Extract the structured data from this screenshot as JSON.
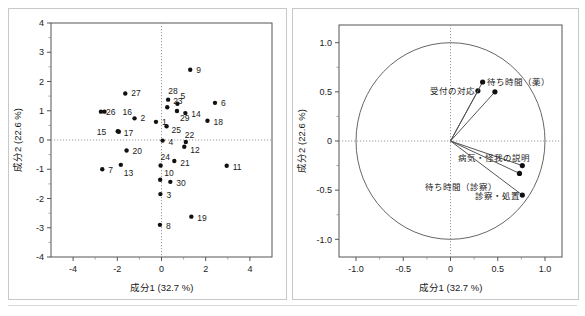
{
  "figure": {
    "name": "pca-biplot-figure",
    "panels": [
      "score-plot",
      "loading-plot"
    ]
  },
  "chart_data": [
    {
      "type": "scatter",
      "name": "score-plot",
      "title": "",
      "xlabel": "成分1  (32.7 %)",
      "ylabel": "成分2  (22.6 %)",
      "xlim": [
        -5,
        5
      ],
      "ylim": [
        -4,
        4
      ],
      "xticks": [
        -4,
        -2,
        0,
        2,
        4
      ],
      "xticklabels": [
        "-4",
        "-2",
        "0",
        "2",
        "4"
      ],
      "yticks": [
        -4,
        -3,
        -2,
        -1,
        0,
        1,
        2,
        3,
        4
      ],
      "yticklabels": [
        "-4",
        "-3",
        "-2",
        "-1",
        "0",
        "1",
        "2",
        "3",
        "4"
      ],
      "grid": false,
      "zero_lines": true,
      "legend": "none",
      "points": [
        {
          "label": "1",
          "x": -0.25,
          "y": 0.62,
          "lx": 6,
          "ly": 3
        },
        {
          "label": "2",
          "x": -1.22,
          "y": 0.74,
          "lx": 6,
          "ly": 3
        },
        {
          "label": "3",
          "x": -0.05,
          "y": -1.85,
          "lx": 6,
          "ly": 4
        },
        {
          "label": "4",
          "x": 0.05,
          "y": -0.02,
          "lx": 6,
          "ly": 4
        },
        {
          "label": "5",
          "x": 0.72,
          "y": 1.24,
          "lx": 3,
          "ly": -5
        },
        {
          "label": "6",
          "x": 2.42,
          "y": 1.27,
          "lx": 6,
          "ly": 3
        },
        {
          "label": "7",
          "x": -2.68,
          "y": -1.0,
          "lx": 6,
          "ly": 4
        },
        {
          "label": "8",
          "x": -0.07,
          "y": -2.9,
          "lx": 6,
          "ly": 4
        },
        {
          "label": "9",
          "x": 1.3,
          "y": 2.4,
          "lx": 6,
          "ly": 3
        },
        {
          "label": "10",
          "x": -0.06,
          "y": -1.36,
          "lx": 4,
          "ly": -4
        },
        {
          "label": "11",
          "x": 2.95,
          "y": -0.88,
          "lx": 6,
          "ly": 4
        },
        {
          "label": "12",
          "x": 1.03,
          "y": -0.23,
          "lx": 6,
          "ly": 6
        },
        {
          "label": "13",
          "x": -1.84,
          "y": -0.85,
          "lx": 3,
          "ly": 11
        },
        {
          "label": "14",
          "x": 1.08,
          "y": 0.92,
          "lx": 6,
          "ly": 4
        },
        {
          "label": "15",
          "x": -1.98,
          "y": 0.3,
          "lx": -21,
          "ly": 4
        },
        {
          "label": "16",
          "x": -2.58,
          "y": 0.97,
          "lx": 18,
          "ly": 3
        },
        {
          "label": "17",
          "x": -1.93,
          "y": 0.28,
          "lx": 5,
          "ly": 4
        },
        {
          "label": "18",
          "x": 2.08,
          "y": 0.66,
          "lx": 6,
          "ly": 4
        },
        {
          "label": "19",
          "x": 1.35,
          "y": -2.62,
          "lx": 6,
          "ly": 4
        },
        {
          "label": "20",
          "x": -1.58,
          "y": -0.36,
          "lx": 6,
          "ly": 3
        },
        {
          "label": "21",
          "x": 0.58,
          "y": -0.72,
          "lx": 6,
          "ly": 5
        },
        {
          "label": "22",
          "x": 1.1,
          "y": -0.07,
          "lx": -1,
          "ly": -4
        },
        {
          "label": "23",
          "x": 0.3,
          "y": 1.38,
          "lx": 5,
          "ly": 4
        },
        {
          "label": "24",
          "x": -0.04,
          "y": -0.87,
          "lx": 0,
          "ly": -5
        },
        {
          "label": "25",
          "x": 0.23,
          "y": 0.47,
          "lx": 5,
          "ly": 7
        },
        {
          "label": "26",
          "x": -2.74,
          "y": 0.97,
          "lx": 5,
          "ly": 3
        },
        {
          "label": "27",
          "x": -1.64,
          "y": 1.59,
          "lx": 6,
          "ly": 3
        },
        {
          "label": "28",
          "x": 0.26,
          "y": 1.12,
          "lx": 1,
          "ly": -13
        },
        {
          "label": "29",
          "x": 0.7,
          "y": 0.99,
          "lx": 3,
          "ly": 10
        },
        {
          "label": "30",
          "x": 0.4,
          "y": -1.43,
          "lx": 6,
          "ly": 4
        }
      ]
    },
    {
      "type": "scatter",
      "name": "loading-plot",
      "title": "",
      "xlabel": "成分1  (32.7 %)",
      "ylabel": "成分2  (22.6 %)",
      "xlim": [
        -1.18,
        1.18
      ],
      "ylim": [
        -1.18,
        1.18
      ],
      "xticks": [
        -1.0,
        -0.5,
        0,
        0.5,
        1.0
      ],
      "xticklabels": [
        "-1.0",
        "-0.5",
        "0",
        "0.5",
        "1.0"
      ],
      "yticks": [
        -1.0,
        -0.5,
        0,
        0.5,
        1.0
      ],
      "yticklabels": [
        "-1.0",
        "-0.5",
        "0",
        "0.5",
        "1.0"
      ],
      "grid": false,
      "zero_lines": true,
      "unit_circle": true,
      "legend": "none",
      "loadings": [
        {
          "label": "受付の対応",
          "x": 0.29,
          "y": 0.51,
          "anchor": "end",
          "lx": -3,
          "ly": 3
        },
        {
          "label": "待ち時間（薬）",
          "x": 0.34,
          "y": 0.6,
          "anchor": "start",
          "lx": 4,
          "ly": 3
        },
        {
          "label": "",
          "x": 0.47,
          "y": 0.5,
          "anchor": "start",
          "lx": 4,
          "ly": 3
        },
        {
          "label": "病気・怪我の説明",
          "x": 0.76,
          "y": -0.25,
          "anchor": "end",
          "lx": 8,
          "ly": -5
        },
        {
          "label": "待ち時間（診察）",
          "x": 0.73,
          "y": -0.33,
          "anchor": "end",
          "lx": -22,
          "ly": 17
        },
        {
          "label": "診察・処置",
          "x": 0.76,
          "y": -0.55,
          "anchor": "end",
          "lx": -2,
          "ly": 4
        }
      ]
    }
  ]
}
